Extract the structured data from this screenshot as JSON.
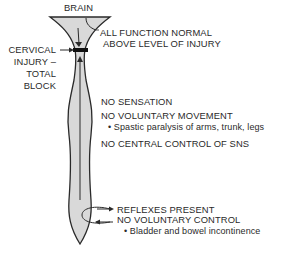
{
  "diagram": {
    "title_top": "BRAIN",
    "injury_label": [
      "CERVICAL",
      "INJURY –",
      "TOTAL",
      "BLOCK"
    ],
    "above_injury": [
      "ALL FUNCTION NORMAL",
      "ABOVE LEVEL OF INJURY"
    ],
    "below_injury": {
      "line1": "NO SENSATION",
      "line2": "NO VOLUNTARY MOVEMENT",
      "bullet1": "• Spastic paralysis of arms, trunk, legs",
      "line3": "NO CENTRAL CONTROL OF SNS"
    },
    "reflex": {
      "line1": "REFLEXES PRESENT",
      "line2": "NO VOLUNTARY CONTROL",
      "bullet1": "• Bladder and bowel incontinence"
    },
    "colors": {
      "cord_fill": "#d9d9d9",
      "outline": "#2a2a2a",
      "block": "#111111"
    }
  }
}
